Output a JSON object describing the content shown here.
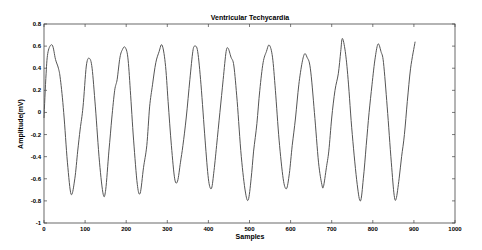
{
  "chart_data": {
    "type": "line",
    "title": "Ventricular Techycardia",
    "xlabel": "Samples",
    "ylabel": "Amplitude(mV)",
    "xlim": [
      0,
      1000
    ],
    "ylim": [
      -1,
      0.8
    ],
    "xticks": [
      0,
      100,
      200,
      300,
      400,
      500,
      600,
      700,
      800,
      900,
      1000
    ],
    "yticks": [
      -1,
      -0.8,
      -0.6,
      -0.4,
      -0.2,
      0,
      0.2,
      0.4,
      0.6,
      0.8
    ],
    "xtick_labels": [
      "0",
      "100",
      "200",
      "300",
      "400",
      "500",
      "600",
      "700",
      "800",
      "900",
      "1000"
    ],
    "ytick_labels": [
      "-1",
      "-0.8",
      "-0.6",
      "-0.4",
      "-0.2",
      "0",
      "0.2",
      "0.4",
      "0.6",
      "0.8"
    ],
    "grid": false,
    "legend": null,
    "line_color": "#555555",
    "series": [
      {
        "name": "Ventricular Techycardia",
        "x": [
          0,
          5,
          10,
          20,
          28,
          35,
          40,
          48,
          57,
          66,
          75,
          82,
          88,
          95,
          103,
          110,
          117,
          125,
          135,
          144,
          150,
          158,
          165,
          172,
          178,
          185,
          191,
          197,
          204,
          210,
          218,
          227,
          234,
          242,
          250,
          257,
          264,
          272,
          280,
          287,
          295,
          302,
          310,
          318,
          325,
          332,
          338,
          346,
          355,
          362,
          367,
          374,
          382,
          392,
          400,
          407,
          413,
          420,
          428,
          436,
          443,
          448,
          455,
          462,
          470,
          480,
          490,
          497,
          504,
          510,
          518,
          525,
          533,
          541,
          548,
          556,
          563,
          572,
          582,
          590,
          597,
          604,
          612,
          620,
          628,
          634,
          640,
          648,
          658,
          668,
          676,
          680,
          687,
          693,
          700,
          708,
          716,
          722,
          726,
          733,
          740,
          750,
          762,
          770,
          777,
          784,
          791,
          798,
          806,
          813,
          820,
          826,
          835,
          845,
          852,
          857,
          864,
          870,
          877,
          884,
          892,
          903
        ],
        "y": [
          -0.05,
          0.35,
          0.55,
          0.61,
          0.48,
          0.4,
          0.3,
          0.0,
          -0.45,
          -0.74,
          -0.6,
          -0.35,
          -0.15,
          0.05,
          0.42,
          0.49,
          0.4,
          0.05,
          -0.45,
          -0.74,
          -0.7,
          -0.35,
          -0.05,
          0.2,
          0.3,
          0.5,
          0.57,
          0.59,
          0.5,
          0.2,
          -0.25,
          -0.65,
          -0.73,
          -0.5,
          -0.3,
          0.05,
          0.25,
          0.45,
          0.55,
          0.61,
          0.45,
          0.1,
          -0.3,
          -0.6,
          -0.62,
          -0.45,
          -0.3,
          -0.05,
          0.3,
          0.55,
          0.6,
          0.55,
          0.25,
          -0.25,
          -0.6,
          -0.69,
          -0.55,
          -0.3,
          0.0,
          0.3,
          0.55,
          0.58,
          0.5,
          0.42,
          0.1,
          -0.4,
          -0.72,
          -0.79,
          -0.6,
          -0.35,
          -0.1,
          0.2,
          0.45,
          0.55,
          0.61,
          0.5,
          0.2,
          -0.25,
          -0.6,
          -0.69,
          -0.55,
          -0.3,
          -0.05,
          0.25,
          0.45,
          0.53,
          0.5,
          0.4,
          0.0,
          -0.45,
          -0.65,
          -0.67,
          -0.5,
          -0.35,
          -0.05,
          0.2,
          0.35,
          0.55,
          0.67,
          0.55,
          0.3,
          -0.2,
          -0.65,
          -0.8,
          -0.6,
          -0.3,
          0.0,
          0.25,
          0.5,
          0.62,
          0.55,
          0.45,
          0.05,
          -0.45,
          -0.75,
          -0.78,
          -0.6,
          -0.4,
          -0.2,
          0.1,
          0.4,
          0.64
        ]
      }
    ]
  }
}
